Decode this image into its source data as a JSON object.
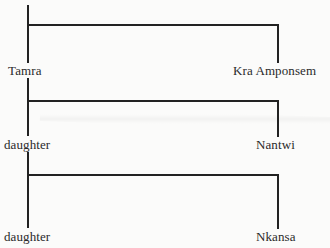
{
  "diagram": {
    "type": "kinship-chart",
    "generations": [
      {
        "left": "Tamra",
        "right": "Kra Amponsem"
      },
      {
        "left": "daughter",
        "right": "Nantwi"
      },
      {
        "left": "daughter",
        "right": "Nkansa"
      }
    ],
    "line_color": "#222222",
    "background": "#fbfbfa"
  }
}
